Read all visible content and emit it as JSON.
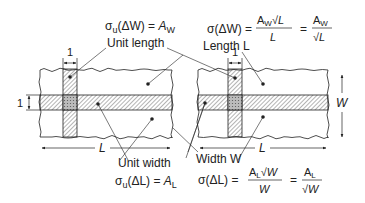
{
  "colors": {
    "ink": "#222222",
    "background": "#ffffff",
    "hatch": "#444444"
  },
  "top_left": {
    "formula_lhs": "σ",
    "formula_sub": "u",
    "formula_arg": "(ΔW) = ",
    "formula_rhs": "A",
    "formula_rhs_sub": "W",
    "label": "Unit length",
    "tick_label": "1"
  },
  "top_right": {
    "formula_lhs": "σ(ΔW) =",
    "frac1_num": "A",
    "frac1_num_sub": "W",
    "frac1_num_root": "√L",
    "frac1_den": "L",
    "equals": "=",
    "frac2_num": "A",
    "frac2_num_sub": "W",
    "frac2_den": "√L",
    "label": "Length L",
    "tick_label": "1"
  },
  "left_side": {
    "tick_label": "1"
  },
  "dimensions": {
    "left_L": "L",
    "right_L": "L",
    "right_W": "W"
  },
  "bottom_left": {
    "label": "Unit width",
    "formula_lhs": "σ",
    "formula_sub": "u",
    "formula_arg": "(ΔL) = ",
    "formula_rhs": "A",
    "formula_rhs_sub": "L"
  },
  "bottom_right": {
    "label": "Width W",
    "formula_lhs": "σ(ΔL) =",
    "frac1_num": "A",
    "frac1_num_sub": "L",
    "frac1_num_root": "√W",
    "frac1_den": "W",
    "equals": "=",
    "frac2_num": "A",
    "frac2_num_sub": "L",
    "frac2_den": "√W"
  }
}
